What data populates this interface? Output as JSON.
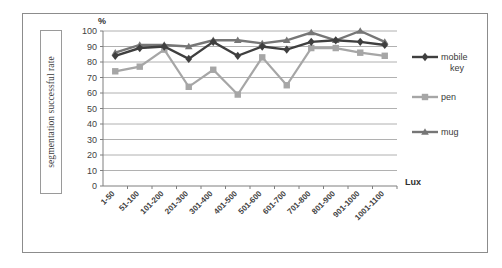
{
  "figure": {
    "y_axis_title": "segmentation successful rate",
    "y_unit_label": "%",
    "x_unit_label": "Lux"
  },
  "chart_data": {
    "type": "line",
    "title": "",
    "subtitle": "",
    "xlabel": "Lux",
    "ylabel": "segmentation successful rate",
    "y_unit": "%",
    "ylim": [
      0,
      100
    ],
    "ytick_step": 10,
    "yticks": [
      0,
      10,
      20,
      30,
      40,
      50,
      60,
      70,
      80,
      90,
      100
    ],
    "grid": "horizontal",
    "legend_position": "right",
    "categories": [
      "1-50",
      "51-100",
      "101-200",
      "201-300",
      "301-400",
      "401-500",
      "501-600",
      "601-700",
      "701-800",
      "801-900",
      "901-1000",
      "1001-1100"
    ],
    "series": [
      {
        "name": "mobile key",
        "color": "#3f3f3f",
        "marker": "diamond",
        "values": [
          84,
          89,
          90,
          82,
          93,
          84,
          90,
          88,
          93,
          94,
          93,
          91
        ]
      },
      {
        "name": "pen",
        "color": "#a6a6a6",
        "marker": "square",
        "values": [
          74,
          77,
          88,
          64,
          75,
          59,
          83,
          65,
          89,
          89,
          86,
          84
        ]
      },
      {
        "name": "mug",
        "color": "#767676",
        "marker": "triangle",
        "values": [
          86,
          91,
          91,
          90,
          94,
          94,
          92,
          94,
          99,
          94,
          100,
          93
        ]
      }
    ]
  },
  "legend": {
    "entries": [
      {
        "label_line1": "mobile",
        "label_line2": "key"
      },
      {
        "label_line1": "pen",
        "label_line2": ""
      },
      {
        "label_line1": "mug",
        "label_line2": ""
      }
    ]
  }
}
